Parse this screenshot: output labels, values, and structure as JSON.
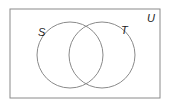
{
  "diagram": {
    "type": "venn",
    "universe": {
      "label": "U",
      "x": 10,
      "y": 9,
      "width": 150,
      "height": 89
    },
    "sets": [
      {
        "label": "S",
        "cx": 70,
        "cy": 55,
        "r": 33
      },
      {
        "label": "T",
        "cx": 102,
        "cy": 55,
        "r": 33
      }
    ],
    "colors": {
      "stroke": "#8a8a8a",
      "text": "#222222",
      "background": "#ffffff"
    }
  }
}
